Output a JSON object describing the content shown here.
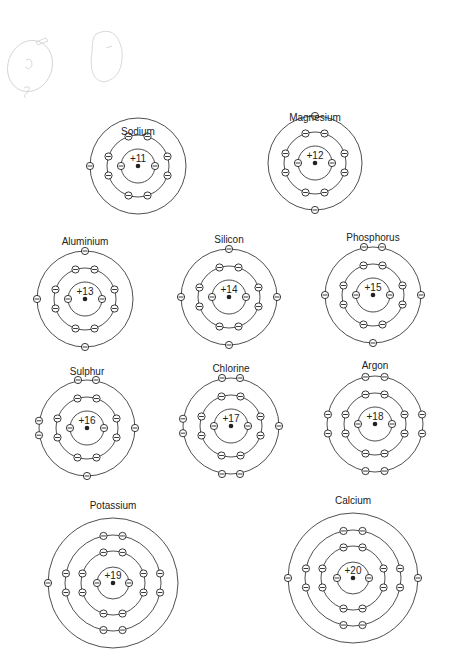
{
  "colors": {
    "ink": "#222222",
    "background": "#ffffff",
    "pencil": "#c8c8c8"
  },
  "atoms": [
    {
      "name": "Sodium",
      "charge": "+11",
      "cx": 138,
      "cy": 166,
      "label_y": 126,
      "shells": [
        2,
        8,
        1
      ],
      "radii": [
        17,
        31,
        48
      ],
      "layout": [
        "pair-sides",
        "oct",
        "left"
      ]
    },
    {
      "name": "Magnesium",
      "charge": "+12",
      "cx": 315,
      "cy": 163,
      "label_y": 112,
      "shells": [
        2,
        8,
        2
      ],
      "radii": [
        17,
        31,
        47
      ],
      "layout": [
        "pair-sides",
        "oct",
        "top-bottom"
      ]
    },
    {
      "name": "Aluminium",
      "charge": "+13",
      "cx": 85,
      "cy": 299,
      "label_y": 236,
      "shells": [
        2,
        8,
        3
      ],
      "radii": [
        17,
        31,
        48
      ],
      "layout": [
        "pair-sides",
        "oct",
        "top-left-bottom"
      ]
    },
    {
      "name": "Silicon",
      "charge": "+14",
      "cx": 229,
      "cy": 297,
      "label_y": 234,
      "shells": [
        2,
        8,
        4
      ],
      "radii": [
        17,
        31,
        48
      ],
      "layout": [
        "pair-sides",
        "oct",
        "four"
      ]
    },
    {
      "name": "Phosphorus",
      "charge": "+15",
      "cx": 373,
      "cy": 295,
      "label_y": 232,
      "shells": [
        2,
        8,
        5
      ],
      "radii": [
        17,
        31,
        48
      ],
      "layout": [
        "pair-sides",
        "oct",
        "five"
      ]
    },
    {
      "name": "Sulphur",
      "charge": "+16",
      "cx": 87,
      "cy": 428,
      "label_y": 366,
      "shells": [
        2,
        8,
        6
      ],
      "radii": [
        17,
        31,
        48
      ],
      "layout": [
        "pair-sides",
        "oct",
        "six"
      ]
    },
    {
      "name": "Chlorine",
      "charge": "+17",
      "cx": 231,
      "cy": 426,
      "label_y": 363,
      "shells": [
        2,
        8,
        7
      ],
      "radii": [
        17,
        31,
        48
      ],
      "layout": [
        "pair-sides",
        "oct",
        "seven"
      ]
    },
    {
      "name": "Argon",
      "charge": "+18",
      "cx": 375,
      "cy": 424,
      "label_y": 360,
      "shells": [
        2,
        8,
        8
      ],
      "radii": [
        17,
        31,
        48
      ],
      "layout": [
        "pair-sides",
        "oct",
        "oct"
      ]
    },
    {
      "name": "Potassium",
      "charge": "+19",
      "cx": 113,
      "cy": 583,
      "label_y": 500,
      "shells": [
        2,
        8,
        8,
        1
      ],
      "radii": [
        16,
        32,
        48,
        65
      ],
      "layout": [
        "pair-sides",
        "oct",
        "oct",
        "left"
      ]
    },
    {
      "name": "Calcium",
      "charge": "+20",
      "cx": 353,
      "cy": 578,
      "label_y": 495,
      "shells": [
        2,
        8,
        8,
        2
      ],
      "radii": [
        16,
        32,
        48,
        65
      ],
      "layout": [
        "pair-sides",
        "oct",
        "oct",
        "left-right"
      ]
    }
  ],
  "legend": {
    "electron_symbol": "⊖",
    "nucleus_symbol": "•"
  }
}
